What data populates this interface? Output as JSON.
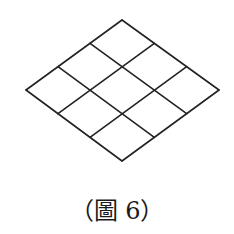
{
  "figure": {
    "caption": "（圖 6）",
    "grid": {
      "rows": 3,
      "cols": 3
    },
    "vertices": {
      "top": [
        122,
        20
      ],
      "right": [
        219,
        90
      ],
      "bottom": [
        122,
        161
      ],
      "left": [
        26,
        90
      ]
    },
    "stroke_color": "#222222",
    "stroke_width": 1.6
  }
}
